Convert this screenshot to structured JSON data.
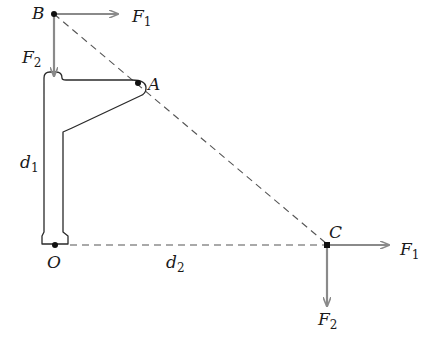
{
  "figure": {
    "colors": {
      "line": "#2a2a2a",
      "arrow": "#8a8a8a",
      "dash": "#555555",
      "point": "#111111",
      "background": "#ffffff"
    },
    "points": {
      "B": {
        "label": "B"
      },
      "A": {
        "label": "A"
      },
      "O": {
        "label": "O"
      },
      "C": {
        "label": "C"
      }
    },
    "forces_at_B": {
      "horizontal": {
        "symbol": "F",
        "subscript": "1"
      },
      "vertical": {
        "symbol": "F",
        "subscript": "2"
      }
    },
    "forces_at_C": {
      "horizontal": {
        "symbol": "F",
        "subscript": "1"
      },
      "vertical": {
        "symbol": "F",
        "subscript": "2"
      }
    },
    "distances": {
      "d1": {
        "symbol": "d",
        "subscript": "1"
      },
      "d2": {
        "symbol": "d",
        "subscript": "2"
      }
    }
  }
}
